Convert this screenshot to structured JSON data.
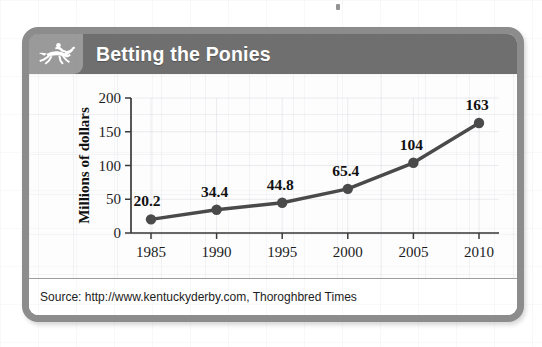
{
  "card": {
    "title": "Betting the Ponies",
    "icon": "horse-jockey-icon",
    "source": "Source: http://www.kentuckyderby.com, Thoroghbred Times",
    "frame_color": "#8c8c8c",
    "header_color": "#6f6f6f",
    "icon_box_color": "#9a9a9a",
    "title_color": "#ffffff"
  },
  "chart_data": {
    "type": "line",
    "title": "Betting the Ponies",
    "xlabel": "",
    "ylabel": "Millions of dollars",
    "categories": [
      "1985",
      "1990",
      "1995",
      "2000",
      "2005",
      "2010"
    ],
    "x": [
      1985,
      1990,
      1995,
      2000,
      2005,
      2010
    ],
    "values": [
      20.2,
      34.4,
      44.8,
      65.4,
      104,
      163
    ],
    "point_labels": [
      "20.2",
      "34.4",
      "44.8",
      "65.4",
      "104",
      "163"
    ],
    "ylim": [
      0,
      200
    ],
    "yticks": [
      0,
      50,
      100,
      150,
      200
    ],
    "ytick_labels": [
      "0",
      "50",
      "100",
      "150",
      "200"
    ],
    "xtick_labels": [
      "1985",
      "1990",
      "1995",
      "2000",
      "2005",
      "2010"
    ],
    "grid": true,
    "legend": null,
    "series_color": "#4a4a4a",
    "marker": "circle",
    "annotation": "Source: http://www.kentuckyderby.com, Thoroghbred Times"
  }
}
